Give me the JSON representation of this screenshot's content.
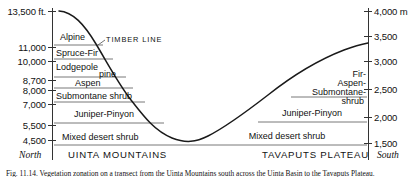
{
  "figure": {
    "axis_left_unit_label": "13,500 ft.",
    "axis_right_unit_label": "4,000 m",
    "left_axis": {
      "unit": "ft",
      "ticks": [
        "13,500 ft.",
        "11,000",
        "10,000",
        "8,700",
        "8,000",
        "7,000",
        "5,500",
        "4,500"
      ],
      "tick_values": [
        13500,
        11000,
        10000,
        8700,
        8000,
        7000,
        5500,
        4500
      ]
    },
    "right_axis": {
      "unit": "m",
      "ticks": [
        "4,000 m",
        "3,500",
        "3,000",
        "2,500",
        "2,000",
        "1,500"
      ],
      "tick_values": [
        4000,
        3500,
        3000,
        2500,
        2000,
        1500
      ]
    },
    "annotations": {
      "timber_line": "TIMBER LINE"
    },
    "compass": {
      "north": "North",
      "south": "South"
    },
    "regions": {
      "left": "UINTA MOUNTAINS",
      "right": "TAVAPUTS PLATEAU"
    },
    "bands_left": [
      {
        "label": "Alpine"
      },
      {
        "label": "Spruce-Fir"
      },
      {
        "label": "Lodgepole"
      },
      {
        "label": "pine"
      },
      {
        "label": "Aspen"
      },
      {
        "label": "Submontane shrub"
      },
      {
        "label": "Juniper-Pinyon"
      },
      {
        "label": "Mixed desert shrub"
      }
    ],
    "bands_right": [
      {
        "label": "Fir-"
      },
      {
        "label": "Aspen-"
      },
      {
        "label": "Submontane-"
      },
      {
        "label": "shrub"
      },
      {
        "label": "Juniper-Pinyon"
      },
      {
        "label": "Mixed desert shrub"
      }
    ],
    "caption": "Fig. 11.14. Vegetation zonation on a transect from the Uinta Mountains south across the Uinta Basin to the Tavaputs Plateau.",
    "colors": {
      "ink": "#111111",
      "line": "#3a3a3a",
      "background": "#ffffff"
    }
  }
}
